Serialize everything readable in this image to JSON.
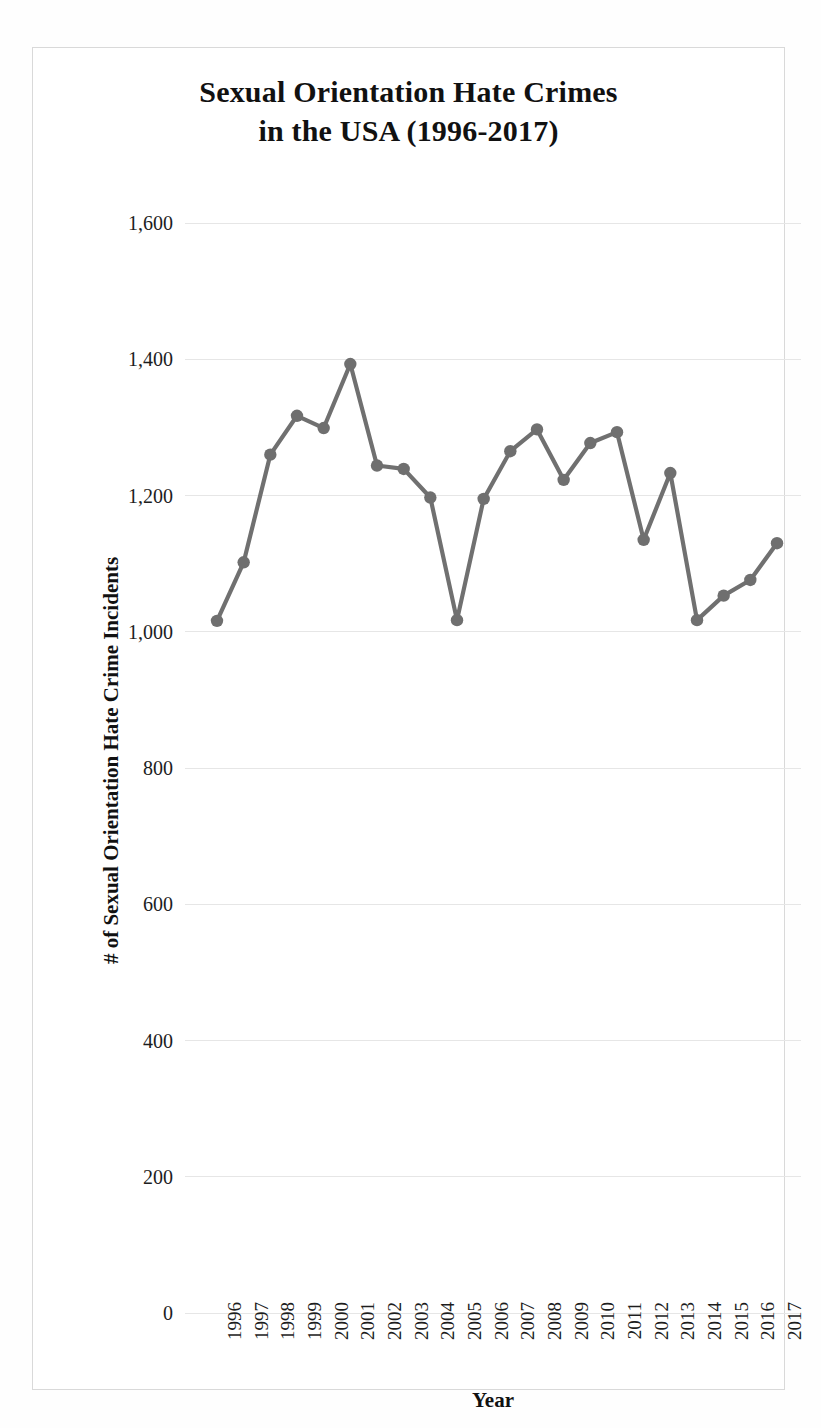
{
  "chart_data": {
    "type": "line",
    "title": "Sexual Orientation Hate Crimes in the USA (1996-2017)",
    "title_lines": [
      "Sexual Orientation Hate Crimes",
      "in the USA (1996-2017)"
    ],
    "xlabel": "Year",
    "ylabel": "# of Sexual Orientation Hate Crime Incidents",
    "categories": [
      "1996",
      "1997",
      "1998",
      "1999",
      "2000",
      "2001",
      "2002",
      "2003",
      "2004",
      "2005",
      "2006",
      "2007",
      "2008",
      "2009",
      "2010",
      "2011",
      "2012",
      "2013",
      "2014",
      "2015",
      "2016",
      "2017"
    ],
    "values": [
      1016,
      1102,
      1260,
      1317,
      1299,
      1393,
      1244,
      1239,
      1197,
      1017,
      1195,
      1265,
      1297,
      1223,
      1277,
      1293,
      1135,
      1233,
      1017,
      1053,
      1076,
      1130
    ],
    "series": [
      {
        "name": "Sexual Orientation Hate Crime Incidents",
        "values": [
          1016,
          1102,
          1260,
          1317,
          1299,
          1393,
          1244,
          1239,
          1197,
          1017,
          1195,
          1265,
          1297,
          1223,
          1277,
          1293,
          1135,
          1233,
          1017,
          1053,
          1076,
          1130
        ]
      }
    ],
    "ylim": [
      0,
      1600
    ],
    "yticks": [
      0,
      200,
      400,
      600,
      800,
      1000,
      1200,
      1400,
      1600
    ],
    "ytick_labels": [
      "0",
      "200",
      "400",
      "600",
      "800",
      "1,000",
      "1,200",
      "1,400",
      "1,600"
    ],
    "grid": true,
    "legend": "none",
    "series_color": "#6f6f6f",
    "gridline_color": "#e6e6e6",
    "marker": "circle"
  }
}
